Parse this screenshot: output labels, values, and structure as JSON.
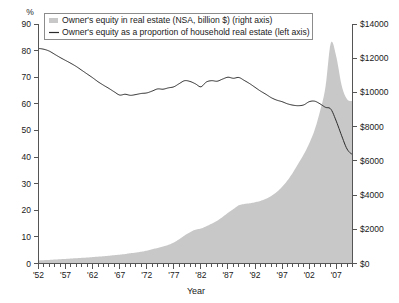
{
  "legend": {
    "position": "top",
    "entries": [
      {
        "marker": "area-swatch",
        "label": "Owner's equity in real estate (NSA, billion $) (right axis)",
        "color": "#c8c8c8"
      },
      {
        "marker": "line-swatch",
        "label": "Owner's equity as a proportion of household real estate (left axis)",
        "color": "#2b2b2b"
      }
    ]
  },
  "axes": {
    "left": {
      "unit": "%",
      "min": 0,
      "max": 90,
      "step": 10,
      "ticks": [
        "0",
        "10",
        "20",
        "30",
        "40",
        "50",
        "60",
        "70",
        "80",
        "90"
      ]
    },
    "right": {
      "min": 0,
      "max": 14000,
      "step": 2000,
      "ticks": [
        "$0",
        "$2000",
        "$4000",
        "$6000",
        "$8000",
        "$10000",
        "$12000",
        "$14000"
      ]
    },
    "bottom": {
      "title": "Year",
      "ticks": [
        "'52",
        "'57",
        "'62",
        "'67",
        "'72",
        "'77",
        "'82",
        "'87",
        "'92",
        "'97",
        "'02",
        "'07"
      ],
      "tick_years": [
        1952,
        1957,
        1962,
        1967,
        1972,
        1977,
        1982,
        1987,
        1992,
        1997,
        2002,
        2007
      ],
      "min_year": 1952,
      "max_year": 2010
    }
  },
  "colors": {
    "area_fill": "#c8c8c8",
    "line_stroke": "#2b2b2b",
    "axis": "#555555",
    "background": "#ffffff"
  },
  "chart_data": {
    "type": "line",
    "title": "",
    "subtitle": "",
    "xlabel": "Year",
    "ylabel": "%",
    "y2label": "billion $",
    "xlim": [
      1952,
      2010
    ],
    "ylim": [
      0,
      90
    ],
    "y2lim": [
      0,
      14000
    ],
    "grid": false,
    "legend_position": "top",
    "x": [
      1952,
      1953,
      1954,
      1955,
      1956,
      1957,
      1958,
      1959,
      1960,
      1961,
      1962,
      1963,
      1964,
      1965,
      1966,
      1967,
      1968,
      1969,
      1970,
      1971,
      1972,
      1973,
      1974,
      1975,
      1976,
      1977,
      1978,
      1979,
      1980,
      1981,
      1982,
      1983,
      1984,
      1985,
      1986,
      1987,
      1988,
      1989,
      1990,
      1991,
      1992,
      1993,
      1994,
      1995,
      1996,
      1997,
      1998,
      1999,
      2000,
      2001,
      2002,
      2003,
      2004,
      2005,
      2006,
      2007,
      2008,
      2009,
      2010
    ],
    "series": [
      {
        "name": "Owner's equity as a proportion of household real estate (left axis)",
        "axis": "left",
        "unit": "%",
        "render": "line",
        "color": "#2b2b2b",
        "values": [
          80.8,
          80.5,
          79.8,
          78.6,
          77.4,
          76.3,
          75.2,
          74.0,
          72.6,
          71.2,
          69.8,
          68.3,
          67.0,
          65.8,
          64.5,
          63.3,
          63.6,
          63.2,
          63.5,
          63.9,
          64.1,
          64.8,
          65.6,
          65.5,
          66.0,
          66.4,
          67.6,
          68.7,
          68.4,
          67.5,
          66.4,
          68.2,
          68.7,
          68.5,
          69.3,
          70.0,
          69.6,
          69.9,
          68.8,
          67.6,
          66.2,
          64.8,
          63.6,
          62.3,
          61.4,
          60.8,
          60.0,
          59.5,
          59.3,
          59.6,
          60.8,
          61.0,
          60.0,
          58.7,
          58.0,
          53.5,
          48.0,
          43.0,
          41.0
        ]
      },
      {
        "name": "Owner's equity in real estate (NSA, billion $) (right axis)",
        "axis": "right",
        "unit": "billion $",
        "render": "area",
        "color": "#c8c8c8",
        "values": [
          180,
          195,
          210,
          230,
          250,
          270,
          290,
          310,
          330,
          350,
          375,
          400,
          425,
          455,
          485,
          515,
          555,
          600,
          640,
          690,
          750,
          830,
          910,
          990,
          1090,
          1230,
          1420,
          1640,
          1830,
          1980,
          2040,
          2180,
          2330,
          2500,
          2720,
          2960,
          3180,
          3400,
          3480,
          3520,
          3580,
          3660,
          3780,
          3950,
          4180,
          4480,
          4860,
          5320,
          5850,
          6380,
          7020,
          7800,
          8900,
          10300,
          12900,
          12100,
          10400,
          9600,
          9500
        ]
      }
    ]
  }
}
